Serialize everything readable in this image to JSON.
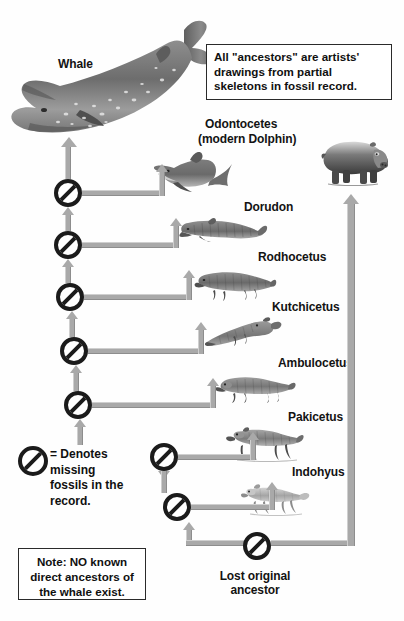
{
  "diagram": {
    "title_label": "Whale",
    "callout": {
      "text": "All \"ancestors\" are artists' drawings from partial skeletons in fossil record."
    },
    "note_box": {
      "text": "Note: NO known direct ancestors of the whale exist."
    },
    "legend": {
      "text": "= Denotes missing fossils in the record.",
      "symbol_name": "prohibition-sign"
    },
    "labels": {
      "whale": "Whale",
      "odontocetes_line1": "Odontocetes",
      "odontocetes_line2": "(modern Dolphin)",
      "dorudon": "Dorudon",
      "rodhocetus": "Rodhocetus",
      "kutchicetus": "Kutchicetus",
      "ambulocetus": "Ambulocetus",
      "pakicetus": "Pakicetus",
      "indohyus": "Indohyus",
      "lost_ancestor_line1": "Lost original",
      "lost_ancestor_line2": "ancestor"
    },
    "colors": {
      "arrow": "#a9a9a9",
      "arrow_light": "#cfcfcf",
      "arrow_dark": "#8d8d8d",
      "ink": "#1b1b1b",
      "background": "#fefefe"
    },
    "missing_fossil_markers": 8,
    "organisms": [
      {
        "name": "Whale",
        "icon": "whale-illustration"
      },
      {
        "name": "Odontocetes (modern Dolphin)",
        "icon": "dolphin-illustration"
      },
      {
        "name": "Dorudon",
        "icon": "dorudon-illustration"
      },
      {
        "name": "Rodhocetus",
        "icon": "rodhocetus-illustration"
      },
      {
        "name": "Kutchicetus",
        "icon": "kutchicetus-illustration"
      },
      {
        "name": "Ambulocetus",
        "icon": "ambulocetus-illustration"
      },
      {
        "name": "Pakicetus",
        "icon": "pakicetus-illustration"
      },
      {
        "name": "Indohyus",
        "icon": "indohyus-illustration"
      },
      {
        "name": "Hippopotamus",
        "icon": "hippo-illustration"
      },
      {
        "name": "Lost original ancestor",
        "icon": "prohibition-sign"
      }
    ]
  }
}
